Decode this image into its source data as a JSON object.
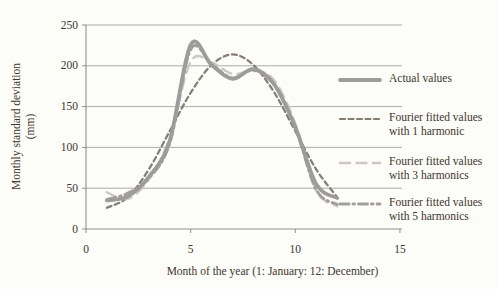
{
  "page": {
    "background": "#fcfcf8",
    "text_color": "#3c362e"
  },
  "colors": {
    "gridline": "#a3a3a3",
    "axis": "#8f8f8f",
    "actual": "#9c9c9c",
    "harmonic1": "#847d74",
    "harmonic3": "#c9c8c4",
    "harmonic5": "#a19f9b"
  },
  "y_axis": {
    "title_line1": "Monthly standard deviation",
    "title_line2": "(mm)",
    "ticks": [
      "0",
      "50",
      "100",
      "150",
      "200",
      "250"
    ],
    "tick_values": [
      0,
      50,
      100,
      150,
      200,
      250
    ]
  },
  "x_axis": {
    "title": "Month of the year (1: January: 12: December)",
    "ticks": [
      "0",
      "5",
      "10",
      "15"
    ],
    "tick_values": [
      0,
      5,
      10,
      15
    ]
  },
  "legend": {
    "items": [
      {
        "id": "actual",
        "lines": [
          "Actual values"
        ],
        "color": "#9c9c9c"
      },
      {
        "id": "harmonic1",
        "lines": [
          "Fourier fitted values",
          "with 1 harmonic"
        ],
        "color": "#847d74"
      },
      {
        "id": "harmonic3",
        "lines": [
          "Fourier fitted values",
          "with 3 harmonics"
        ],
        "color": "#c9c8c4"
      },
      {
        "id": "harmonic5",
        "lines": [
          "Fourier fitted values",
          "with 5 harmonics"
        ],
        "color": "#a19f9b"
      }
    ]
  },
  "chart_data": {
    "type": "line",
    "title": "",
    "xlabel": "Month of the year (1: January: 12: December)",
    "ylabel": "Monthly standard deviation (mm)",
    "xlim": [
      0,
      15
    ],
    "ylim": [
      0,
      250
    ],
    "grid": "horizontal",
    "legend_position": "right",
    "x": [
      1,
      2,
      3,
      4,
      5,
      6,
      7,
      8,
      9,
      10,
      11,
      12
    ],
    "series": [
      {
        "name": "Actual values",
        "id": "actual",
        "color": "#9c9c9c",
        "line_style": "solid-thick",
        "values": [
          35,
          40,
          64,
          108,
          226,
          201,
          184,
          196,
          177,
          125,
          55,
          38
        ]
      },
      {
        "name": "Fourier fitted values with 1 harmonic",
        "id": "harmonic1",
        "color": "#847d74",
        "line_style": "dashed-short",
        "values": [
          26,
          39,
          73,
          120,
          167,
          201,
          214,
          201,
          167,
          120,
          73,
          39
        ]
      },
      {
        "name": "Fourier fitted values with 3 harmonics",
        "id": "harmonic3",
        "color": "#c9c8c4",
        "line_style": "dashed-long",
        "values": [
          45,
          37,
          61,
          112,
          205,
          204,
          190,
          194,
          182,
          129,
          47,
          28
        ]
      },
      {
        "name": "Fourier fitted values with 5 harmonics",
        "id": "harmonic5",
        "color": "#a19f9b",
        "line_style": "dash-dot",
        "values": [
          36,
          44,
          62,
          105,
          220,
          202,
          185,
          195,
          176,
          124,
          48,
          30
        ]
      }
    ]
  }
}
